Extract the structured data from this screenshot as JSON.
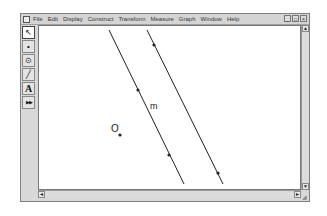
{
  "menubar": {
    "items": [
      "File",
      "Edit",
      "Display",
      "Construct",
      "Transform",
      "Measure",
      "Graph",
      "Window",
      "Help"
    ],
    "window_controls": [
      "_",
      "□",
      "×"
    ]
  },
  "toolbox": {
    "tools": [
      {
        "name": "selection-arrow-tool",
        "glyph": "↖"
      },
      {
        "name": "point-tool",
        "glyph": "•"
      },
      {
        "name": "compass-tool",
        "glyph": "⊙"
      },
      {
        "name": "straightedge-tool",
        "glyph": "╱"
      },
      {
        "name": "text-tool",
        "glyph": "A"
      },
      {
        "name": "custom-tool",
        "glyph": "▶▶"
      }
    ]
  },
  "canvas": {
    "labels": {
      "line_label": "m",
      "point_label": "O"
    },
    "line_color": "#222222"
  },
  "scrollbars": {
    "up": "▲",
    "down": "▼",
    "left": "◄",
    "right": "►"
  }
}
